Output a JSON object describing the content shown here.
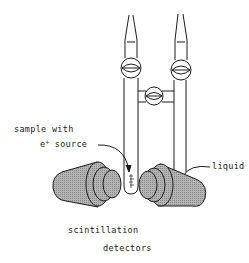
{
  "diagram": {
    "type": "apparatus-schematic",
    "labels": {
      "sample_line1": "sample with",
      "sample_line2_prefix": "e",
      "sample_line2_sup": "+",
      "sample_line2_suffix": " source",
      "liquid": "liquid",
      "detectors_line1": "scintillation",
      "detectors_line2": "detectors"
    },
    "components": [
      {
        "id": "left-tube",
        "kind": "glass tube with tapered top and stopcock"
      },
      {
        "id": "right-tube",
        "kind": "glass tube with tapered top and stopcock"
      },
      {
        "id": "middle-stopcock",
        "kind": "connecting stopcock between tubes"
      },
      {
        "id": "sample-cell",
        "kind": "sample with e+ source at bottom of left tube"
      },
      {
        "id": "left-detector",
        "kind": "scintillation detector"
      },
      {
        "id": "right-detector",
        "kind": "scintillation detector"
      }
    ],
    "colors": {
      "line": "#1a1a1a",
      "detector_fill": "#a8a8a8",
      "background": "#ffffff"
    }
  }
}
